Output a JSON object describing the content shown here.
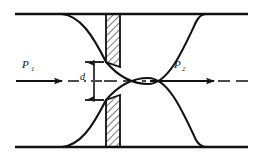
{
  "figure": {
    "kind": "orifice-plate-flowmeter-diagram",
    "width": 260,
    "height": 165,
    "background_color": "#ffffff",
    "line_color": "#111111"
  },
  "labels": {
    "upstream_pressure": "P",
    "upstream_pressure_subscript": "1",
    "downstream_pressure": "P",
    "downstream_pressure_subscript": "2",
    "orifice_diameter": "d"
  },
  "geometry": {
    "pipe_wall_top_y": 14,
    "pipe_wall_bottom_y": 147,
    "pipe_wall_left_x": 15,
    "pipe_wall_right_x": 248,
    "centerline_y": 81,
    "plate_left_x": 106,
    "plate_right_x": 120,
    "orifice_top_y": 62,
    "orifice_bottom_y": 100,
    "vena_contracta_x": 148
  },
  "elements": {
    "pipe_wall_top": "top pipe wall",
    "pipe_wall_bottom": "bottom pipe wall",
    "centerline": "dash-dot axis centerline",
    "orifice_plate_upper": "hatched upper orifice plate",
    "orifice_plate_lower": "hatched lower orifice plate",
    "jet_curve_upper": "upper jet contraction streamline",
    "jet_curve_lower": "lower jet contraction streamline",
    "flow_arrow_upstream": "upstream flow direction arrow",
    "flow_arrow_downstream": "downstream flow direction arrow",
    "dimension_d": "orifice bore diameter dimension"
  }
}
